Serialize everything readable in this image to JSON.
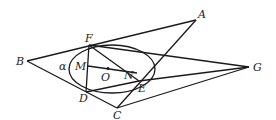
{
  "diagram": {
    "type": "geometry",
    "points": {
      "A": {
        "label": "A",
        "x": 196,
        "y": 20
      },
      "B": {
        "label": "B",
        "x": 27,
        "y": 61
      },
      "C": {
        "label": "C",
        "x": 117,
        "y": 108
      },
      "D": {
        "label": "D",
        "x": 86,
        "y": 92
      },
      "E": {
        "label": "E",
        "x": 139,
        "y": 81
      },
      "F": {
        "label": "F",
        "x": 89,
        "y": 45
      },
      "G": {
        "label": "G",
        "x": 249,
        "y": 67
      },
      "M": {
        "label": "M",
        "x": 88,
        "y": 66
      },
      "N": {
        "label": "N",
        "x": 137,
        "y": 73
      },
      "O": {
        "label": "O",
        "x": 108,
        "y": 68
      }
    },
    "ellipse": {
      "label": "α",
      "cx": 112,
      "cy": 69,
      "rx": 43,
      "ry": 24
    },
    "segments": [
      [
        "B",
        "A"
      ],
      [
        "B",
        "C"
      ],
      [
        "A",
        "C"
      ],
      [
        "F",
        "G"
      ],
      [
        "E",
        "G"
      ],
      [
        "C",
        "G"
      ],
      [
        "F",
        "D"
      ],
      [
        "F",
        "E"
      ],
      [
        "D",
        "E"
      ],
      [
        "M",
        "N"
      ]
    ],
    "labels": {
      "A": "A",
      "B": "B",
      "C": "C",
      "D": "D",
      "E": "E",
      "F": "F",
      "G": "G",
      "M": "M",
      "N": "N",
      "O": "O",
      "alpha": "α"
    }
  }
}
